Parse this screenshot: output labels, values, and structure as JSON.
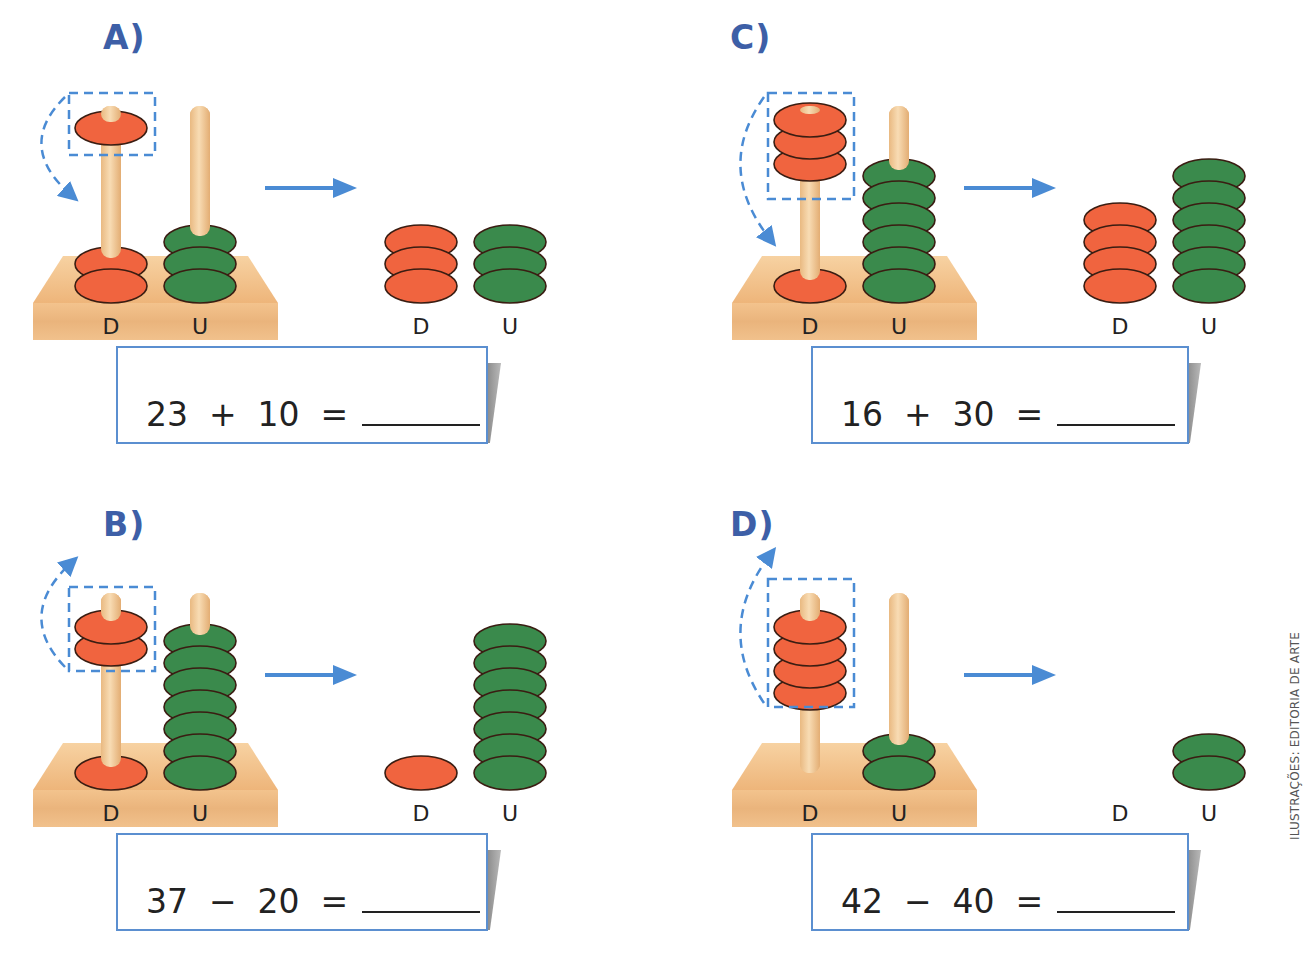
{
  "colors": {
    "label_blue": "#3d5fa7",
    "arrow_blue": "#4a8bd4",
    "tens_disk": "#f0643f",
    "units_disk": "#3a8a4c",
    "wood": "#f2c48e",
    "box_border": "#5b8fd0"
  },
  "rod_labels": {
    "tens": "D",
    "units": "U"
  },
  "credit": "ILUSTRAÇÕES: EDITORIA DE ARTE",
  "panels": [
    {
      "id": "A",
      "label": "A)",
      "operation": "add",
      "before": {
        "tens_base": 2,
        "units": 3,
        "moving_tens": 1
      },
      "after": {
        "tens": 3,
        "units": 3
      },
      "equation": "23  +  10  =",
      "answer": ""
    },
    {
      "id": "B",
      "label": "B)",
      "operation": "subtract",
      "before": {
        "tens_base": 1,
        "units": 7,
        "moving_tens": 2
      },
      "after": {
        "tens": 1,
        "units": 7
      },
      "equation": "37  −  20  =",
      "answer": ""
    },
    {
      "id": "C",
      "label": "C)",
      "operation": "add",
      "before": {
        "tens_base": 1,
        "units": 6,
        "moving_tens": 3
      },
      "after": {
        "tens": 4,
        "units": 6
      },
      "equation": "16  +  30  =",
      "answer": ""
    },
    {
      "id": "D",
      "label": "D)",
      "operation": "subtract",
      "before": {
        "tens_base": 0,
        "units": 2,
        "moving_tens": 4
      },
      "after": {
        "tens": 0,
        "units": 2
      },
      "equation": "42  −  40  =",
      "answer": ""
    }
  ]
}
